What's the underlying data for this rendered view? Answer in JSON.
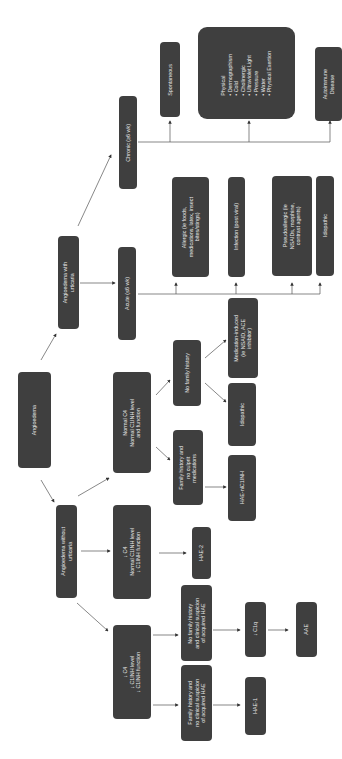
{
  "diagram": {
    "orientation": "rotated 90 degrees counter-clockwise",
    "nodes": {
      "root": "Angioedema",
      "without_urticaria": "Angioedema without\nurticaria",
      "with_urticaria": "Angioedema with\nurticaria",
      "acute": "Acute (≤6 wk)",
      "chronic": "Chronic (≥6 wk)",
      "low_c4_low_c1inh": "↓ C4\n↓ C1INH level\n↓ C1INH function",
      "low_c4_normal_c1inh": "↓ C4\nNormal C1INH level\n↓ C1INH function",
      "normal_c4": "Normal C4\nNormal C1INH level\nand function",
      "no_family_history": "No family history",
      "family_history_no_culprit": "Family history and\nno culprit\nmedications",
      "medication_induced": "Medication-induced\n(ie NSAID, ACE\ninhibitor)",
      "idiopathic_normal": "Idiopathic",
      "hae_nlc1inh": "HAE-nlC1INH",
      "hae_2": "HAE-2",
      "no_family_history_acquired": "No family history\nand clinical suspicion\nof acquired HAE",
      "family_history_no_acquired": "Family history and\nno clinical suspicion\nof acquired HAE",
      "low_c1q": "↓ C1q",
      "aae": "AAE",
      "hae_1": "HAE-1",
      "allergic": "Allergic (ie foods,\nmedications, latex, insect\nbites/stings)",
      "infection": "Infection (post viral)",
      "pseudoallergic": "Pseudoallergic (ie\nNSAIDs, morphine,\ncontrast agents)",
      "idiopathic_acute": "Idiopathic",
      "spontaneous": "Spontaneous",
      "physical": "Physical\n• Dermographism\n• Cold\n• Cholinergic\n• Ultraviolet Light\n• Pressure\n• Water\n• Physical Exertion",
      "autoimmune": "Autoimmune\nDisease"
    },
    "colors": {
      "box_fill": "#3f3f3f",
      "box_text": "#e6e6e6",
      "line": "#444444",
      "background": "#ffffff"
    }
  }
}
